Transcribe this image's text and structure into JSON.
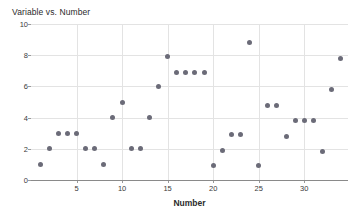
{
  "chart_data": {
    "type": "scatter",
    "title": "Variable vs. Number",
    "xlabel": "Number",
    "ylabel": "Variable",
    "xlim": [
      0,
      34.8
    ],
    "ylim": [
      0,
      10
    ],
    "xticks": [
      5,
      10,
      15,
      20,
      25,
      30
    ],
    "yticks": [
      0,
      2,
      4,
      6,
      8,
      10
    ],
    "grid": true,
    "legend": null,
    "marker_color": "#6b6b78",
    "x": [
      1,
      2,
      3,
      4,
      5,
      6,
      7,
      8,
      9,
      10,
      11,
      12,
      13,
      14,
      15,
      16,
      17,
      18,
      19,
      20,
      21,
      22,
      23,
      24,
      25,
      26,
      27,
      28,
      29,
      30,
      31,
      32,
      33,
      34
    ],
    "y": [
      1.0,
      2.0,
      3.0,
      3.0,
      3.0,
      2.0,
      2.0,
      1.0,
      4.0,
      5.0,
      2.0,
      2.0,
      4.0,
      6.0,
      7.9,
      6.9,
      6.9,
      6.9,
      6.9,
      0.9,
      1.9,
      2.9,
      2.9,
      8.8,
      0.9,
      4.8,
      4.8,
      2.8,
      3.8,
      3.8,
      3.8,
      1.8,
      5.8,
      7.8
    ]
  }
}
